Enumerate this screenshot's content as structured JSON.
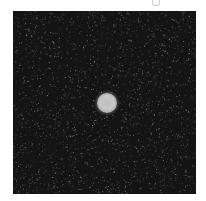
{
  "image": {
    "subject": "bright circular disc centered on a dark noisy background",
    "colors": {
      "background": "#141414",
      "disc": "#c2c2c2",
      "page": "#ffffff"
    },
    "disc": {
      "cx": 94,
      "cy": 92,
      "r": 10
    },
    "frame": {
      "x": 13,
      "y": 11,
      "width": 183,
      "height": 183
    }
  }
}
